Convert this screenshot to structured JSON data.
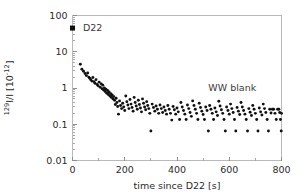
{
  "figure": {
    "name": "iodine-129-decay-plot",
    "background_color": "#ffffff",
    "frame_color": "#b9b9b9",
    "marker_color": "#111111"
  },
  "chart_data": {
    "type": "scatter",
    "title": "",
    "xlabel": "time since D22 [s]",
    "ylabel": "129I/I [10-12]",
    "ylabel_parts": {
      "sup_isotope": "129",
      "base": "I/I [10",
      "sup_exponent": "-12",
      "tail": "]"
    },
    "xlim": [
      0,
      800
    ],
    "ylim": [
      0.01,
      100
    ],
    "yscale": "log",
    "xscale": "linear",
    "grid": false,
    "legend": "none",
    "xticks": [
      0,
      200,
      400,
      600,
      800
    ],
    "xtick_labels": [
      "0",
      "200",
      "400",
      "600",
      "800"
    ],
    "xticks_minor": [
      100,
      300,
      500,
      700
    ],
    "yticks": [
      0.01,
      0.1,
      1,
      10,
      100
    ],
    "ytick_labels": [
      "0.01",
      "0.1",
      "1",
      "10",
      "100"
    ],
    "annotations": [
      {
        "text": "D22",
        "x": 40,
        "y": 45,
        "name": "annotation-d22"
      },
      {
        "text": "WW blank",
        "x": 520,
        "y": 1.05,
        "name": "annotation-ww-blank"
      }
    ],
    "series": [
      {
        "name": "D22 sample",
        "marker": "square",
        "marker_size": 5,
        "color": "#111111",
        "points": [
          [
            0,
            45
          ]
        ]
      },
      {
        "name": "WW blank memory decay",
        "marker": "circle",
        "marker_size": 2,
        "color": "#111111",
        "points": [
          [
            30,
            4.5
          ],
          [
            36,
            3.3
          ],
          [
            42,
            2.9
          ],
          [
            48,
            2.5
          ],
          [
            53,
            2.2
          ],
          [
            58,
            2.6
          ],
          [
            62,
            2.0
          ],
          [
            66,
            1.85
          ],
          [
            70,
            1.7
          ],
          [
            74,
            1.55
          ],
          [
            78,
            1.95
          ],
          [
            82,
            1.5
          ],
          [
            86,
            1.35
          ],
          [
            90,
            1.7
          ],
          [
            94,
            1.25
          ],
          [
            98,
            1.15
          ],
          [
            102,
            1.45
          ],
          [
            106,
            1.05
          ],
          [
            110,
            1.3
          ],
          [
            113,
            0.95
          ],
          [
            116,
            1.2
          ],
          [
            119,
            0.88
          ],
          [
            122,
            1.0
          ],
          [
            125,
            0.8
          ],
          [
            128,
            0.92
          ],
          [
            131,
            0.72
          ],
          [
            134,
            0.85
          ],
          [
            137,
            0.66
          ],
          [
            140,
            0.78
          ],
          [
            143,
            0.6
          ],
          [
            146,
            0.7
          ],
          [
            149,
            0.55
          ],
          [
            152,
            0.64
          ],
          [
            155,
            0.5
          ],
          [
            158,
            0.58
          ],
          [
            161,
            0.46
          ],
          [
            164,
            0.35
          ],
          [
            167,
            0.52
          ],
          [
            170,
            0.4
          ],
          [
            173,
            0.31
          ],
          [
            176,
            0.19
          ],
          [
            180,
            0.44
          ],
          [
            184,
            0.33
          ],
          [
            188,
            0.27
          ],
          [
            192,
            0.38
          ],
          [
            196,
            0.3
          ],
          [
            200,
            0.24
          ],
          [
            204,
            0.6
          ],
          [
            208,
            0.42
          ],
          [
            212,
            0.34
          ],
          [
            216,
            0.27
          ],
          [
            220,
            0.48
          ],
          [
            224,
            0.36
          ],
          [
            228,
            0.29
          ],
          [
            232,
            0.23
          ],
          [
            236,
            0.55
          ],
          [
            240,
            0.4
          ],
          [
            244,
            0.32
          ],
          [
            248,
            0.26
          ],
          [
            252,
            0.46
          ],
          [
            256,
            0.35
          ],
          [
            260,
            0.28
          ],
          [
            264,
            0.22
          ],
          [
            268,
            0.5
          ],
          [
            272,
            0.38
          ],
          [
            276,
            0.3
          ],
          [
            280,
            0.25
          ],
          [
            284,
            0.42
          ],
          [
            288,
            0.33
          ],
          [
            292,
            0.27
          ],
          [
            296,
            0.2
          ],
          [
            300,
            0.065
          ],
          [
            305,
            0.36
          ],
          [
            310,
            0.29
          ],
          [
            315,
            0.23
          ],
          [
            320,
            0.32
          ],
          [
            325,
            0.26
          ],
          [
            330,
            0.2
          ],
          [
            335,
            0.34
          ],
          [
            340,
            0.27
          ],
          [
            345,
            0.21
          ],
          [
            350,
            0.3
          ],
          [
            355,
            0.24
          ],
          [
            360,
            0.19
          ],
          [
            365,
            0.33
          ],
          [
            370,
            0.26
          ],
          [
            375,
            0.2
          ],
          [
            380,
            0.13
          ],
          [
            385,
            0.31
          ],
          [
            390,
            0.25
          ],
          [
            395,
            0.19
          ],
          [
            400,
            0.28
          ],
          [
            405,
            0.22
          ],
          [
            410,
            0.135
          ],
          [
            415,
            0.4
          ],
          [
            420,
            0.3
          ],
          [
            425,
            0.24
          ],
          [
            430,
            0.19
          ],
          [
            435,
            0.135
          ],
          [
            440,
            0.34
          ],
          [
            445,
            0.27
          ],
          [
            450,
            0.21
          ],
          [
            455,
            0.165
          ],
          [
            460,
            0.44
          ],
          [
            465,
            0.33
          ],
          [
            470,
            0.26
          ],
          [
            475,
            0.2
          ],
          [
            480,
            0.135
          ],
          [
            485,
            0.38
          ],
          [
            490,
            0.29
          ],
          [
            495,
            0.23
          ],
          [
            500,
            0.185
          ],
          [
            505,
            0.135
          ],
          [
            510,
            0.3
          ],
          [
            515,
            0.24
          ],
          [
            520,
            0.065
          ],
          [
            525,
            0.33
          ],
          [
            530,
            0.26
          ],
          [
            535,
            0.2
          ],
          [
            540,
            0.135
          ],
          [
            545,
            0.28
          ],
          [
            550,
            0.22
          ],
          [
            555,
            0.175
          ],
          [
            560,
            0.43
          ],
          [
            565,
            0.32
          ],
          [
            570,
            0.25
          ],
          [
            575,
            0.2
          ],
          [
            580,
            0.135
          ],
          [
            585,
            0.065
          ],
          [
            590,
            0.3
          ],
          [
            595,
            0.24
          ],
          [
            600,
            0.19
          ],
          [
            605,
            0.36
          ],
          [
            610,
            0.27
          ],
          [
            615,
            0.21
          ],
          [
            620,
            0.135
          ],
          [
            625,
            0.065
          ],
          [
            630,
            0.29
          ],
          [
            635,
            0.23
          ],
          [
            640,
            0.185
          ],
          [
            645,
            0.4
          ],
          [
            650,
            0.3
          ],
          [
            655,
            0.24
          ],
          [
            660,
            0.19
          ],
          [
            665,
            0.135
          ],
          [
            670,
            0.065
          ],
          [
            675,
            0.27
          ],
          [
            680,
            0.215
          ],
          [
            685,
            0.175
          ],
          [
            690,
            0.33
          ],
          [
            695,
            0.26
          ],
          [
            700,
            0.2
          ],
          [
            705,
            0.135
          ],
          [
            710,
            0.065
          ],
          [
            715,
            0.28
          ],
          [
            720,
            0.22
          ],
          [
            725,
            0.18
          ],
          [
            730,
            0.36
          ],
          [
            735,
            0.27
          ],
          [
            740,
            0.21
          ],
          [
            745,
            0.135
          ],
          [
            750,
            0.065
          ],
          [
            755,
            0.26
          ],
          [
            760,
            0.205
          ],
          [
            765,
            0.26
          ],
          [
            770,
            0.26
          ],
          [
            775,
            0.2
          ],
          [
            780,
            0.135
          ],
          [
            785,
            0.26
          ],
          [
            790,
            0.26
          ],
          [
            793,
            0.21
          ],
          [
            796,
            0.135
          ],
          [
            799,
            0.065
          ],
          [
            800,
            0.2
          ]
        ]
      }
    ]
  }
}
